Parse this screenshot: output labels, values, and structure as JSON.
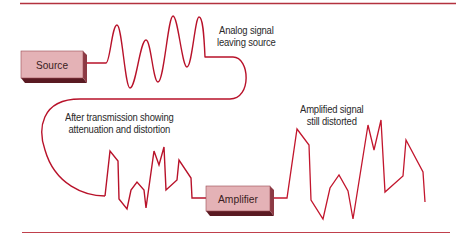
{
  "diagram": {
    "type": "signal-flow",
    "colors": {
      "signal": "#b8122a",
      "rule": "#b3323f",
      "box_face": "#e4b2b6",
      "box_side": "#8c3a44",
      "box_bottom": "#5a1a22",
      "text": "#2a2a2a"
    },
    "nodes": [
      {
        "id": "source",
        "label": "Source"
      },
      {
        "id": "amplifier",
        "label": "Amplifier"
      }
    ],
    "annotations": {
      "analog": {
        "line1": "Analog signal",
        "line2": "leaving source"
      },
      "transmission": {
        "line1": "After transmission showing",
        "line2": "attenuation and distortion"
      },
      "amplified": {
        "line1": "Amplified signal",
        "line2": "still distorted"
      }
    },
    "signals": [
      {
        "id": "analog-signal",
        "shape": "smooth sine wave, varying amplitude"
      },
      {
        "id": "distorted-signal",
        "shape": "attenuated, jagged waveform"
      },
      {
        "id": "amplified-signal",
        "shape": "larger jagged waveform, still distorted"
      }
    ]
  }
}
